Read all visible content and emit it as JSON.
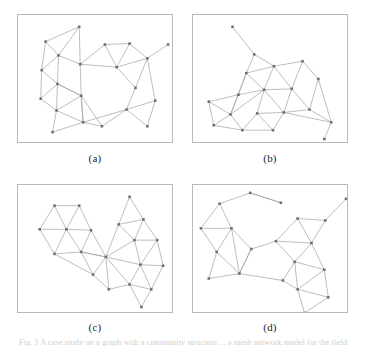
{
  "figure": {
    "type": "multi-panel-graph-figure",
    "panel_count": 4,
    "layout": "2x2",
    "width": 366,
    "height": 346,
    "background_color": "#ffffff",
    "frame_color": "#b9b9b9",
    "edge_color": "#a0a0a0",
    "node_color": "#707070",
    "node_size": 2.6
  },
  "labels": {
    "a": "(a)",
    "b": "(b)",
    "c": "(c)",
    "d": "(d)"
  },
  "caption": {
    "clipped_line": "Fig. 1   A case study on a graph with a community structure   ... a mesh network model for the field"
  },
  "chart_data": [
    {
      "type": "scatter",
      "id": "panel-a",
      "title": "(a)",
      "xlabel": "",
      "ylabel": "",
      "xlim": [
        0,
        156
      ],
      "ylim": [
        0,
        129
      ],
      "grid": false,
      "nodes": [
        {
          "id": 0,
          "x": 62,
          "y": 12
        },
        {
          "id": 1,
          "x": 28,
          "y": 27
        },
        {
          "id": 2,
          "x": 41,
          "y": 41
        },
        {
          "id": 3,
          "x": 24,
          "y": 56
        },
        {
          "id": 4,
          "x": 40,
          "y": 70
        },
        {
          "id": 5,
          "x": 23,
          "y": 85
        },
        {
          "id": 6,
          "x": 39,
          "y": 97
        },
        {
          "id": 7,
          "x": 35,
          "y": 119
        },
        {
          "id": 8,
          "x": 66,
          "y": 109
        },
        {
          "id": 9,
          "x": 64,
          "y": 82
        },
        {
          "id": 10,
          "x": 63,
          "y": 50
        },
        {
          "id": 11,
          "x": 85,
          "y": 113
        },
        {
          "id": 12,
          "x": 88,
          "y": 30
        },
        {
          "id": 13,
          "x": 113,
          "y": 29
        },
        {
          "id": 14,
          "x": 100,
          "y": 53
        },
        {
          "id": 15,
          "x": 119,
          "y": 74
        },
        {
          "id": 16,
          "x": 131,
          "y": 44
        },
        {
          "id": 17,
          "x": 110,
          "y": 96
        },
        {
          "id": 18,
          "x": 139,
          "y": 87
        },
        {
          "id": 19,
          "x": 131,
          "y": 113
        },
        {
          "id": 20,
          "x": 152,
          "y": 30
        }
      ],
      "edges": [
        [
          0,
          1
        ],
        [
          0,
          2
        ],
        [
          0,
          10
        ],
        [
          1,
          2
        ],
        [
          1,
          3
        ],
        [
          2,
          3
        ],
        [
          2,
          4
        ],
        [
          2,
          10
        ],
        [
          3,
          4
        ],
        [
          3,
          5
        ],
        [
          4,
          5
        ],
        [
          4,
          6
        ],
        [
          4,
          9
        ],
        [
          5,
          6
        ],
        [
          6,
          7
        ],
        [
          6,
          8
        ],
        [
          7,
          8
        ],
        [
          8,
          9
        ],
        [
          8,
          11
        ],
        [
          8,
          17
        ],
        [
          9,
          10
        ],
        [
          9,
          4
        ],
        [
          9,
          8
        ],
        [
          10,
          12
        ],
        [
          10,
          14
        ],
        [
          11,
          17
        ],
        [
          12,
          13
        ],
        [
          12,
          14
        ],
        [
          13,
          14
        ],
        [
          13,
          16
        ],
        [
          14,
          15
        ],
        [
          14,
          16
        ],
        [
          15,
          16
        ],
        [
          15,
          17
        ],
        [
          16,
          20
        ],
        [
          16,
          18
        ],
        [
          17,
          18
        ],
        [
          17,
          19
        ],
        [
          18,
          19
        ],
        [
          9,
          11
        ],
        [
          6,
          9
        ]
      ]
    },
    {
      "type": "scatter",
      "id": "panel-b",
      "title": "(b)",
      "xlabel": "",
      "ylabel": "",
      "xlim": [
        0,
        156
      ],
      "ylim": [
        0,
        129
      ],
      "grid": false,
      "nodes": [
        {
          "id": 0,
          "x": 40,
          "y": 12
        },
        {
          "id": 1,
          "x": 62,
          "y": 40
        },
        {
          "id": 2,
          "x": 54,
          "y": 59
        },
        {
          "id": 3,
          "x": 46,
          "y": 81
        },
        {
          "id": 4,
          "x": 16,
          "y": 88
        },
        {
          "id": 5,
          "x": 21,
          "y": 112
        },
        {
          "id": 6,
          "x": 38,
          "y": 101
        },
        {
          "id": 7,
          "x": 50,
          "y": 117
        },
        {
          "id": 8,
          "x": 65,
          "y": 100
        },
        {
          "id": 9,
          "x": 72,
          "y": 76
        },
        {
          "id": 10,
          "x": 82,
          "y": 52
        },
        {
          "id": 11,
          "x": 81,
          "y": 117
        },
        {
          "id": 12,
          "x": 92,
          "y": 99
        },
        {
          "id": 13,
          "x": 100,
          "y": 75
        },
        {
          "id": 14,
          "x": 111,
          "y": 47
        },
        {
          "id": 15,
          "x": 127,
          "y": 65
        },
        {
          "id": 16,
          "x": 118,
          "y": 96
        },
        {
          "id": 17,
          "x": 140,
          "y": 109
        },
        {
          "id": 18,
          "x": 133,
          "y": 126
        }
      ],
      "edges": [
        [
          0,
          1
        ],
        [
          1,
          2
        ],
        [
          1,
          10
        ],
        [
          2,
          3
        ],
        [
          2,
          9
        ],
        [
          2,
          10
        ],
        [
          3,
          4
        ],
        [
          3,
          6
        ],
        [
          3,
          9
        ],
        [
          4,
          5
        ],
        [
          4,
          6
        ],
        [
          5,
          6
        ],
        [
          5,
          7
        ],
        [
          6,
          7
        ],
        [
          6,
          9
        ],
        [
          7,
          8
        ],
        [
          7,
          11
        ],
        [
          8,
          9
        ],
        [
          8,
          11
        ],
        [
          8,
          12
        ],
        [
          9,
          10
        ],
        [
          9,
          12
        ],
        [
          9,
          13
        ],
        [
          10,
          13
        ],
        [
          10,
          14
        ],
        [
          11,
          12
        ],
        [
          12,
          13
        ],
        [
          12,
          16
        ],
        [
          13,
          14
        ],
        [
          13,
          16
        ],
        [
          14,
          15
        ],
        [
          15,
          16
        ],
        [
          15,
          17
        ],
        [
          16,
          17
        ],
        [
          17,
          18
        ],
        [
          12,
          17
        ],
        [
          2,
          6
        ]
      ]
    },
    {
      "type": "scatter",
      "id": "panel-c",
      "title": "(c)",
      "xlabel": "",
      "ylabel": "",
      "xlim": [
        0,
        156
      ],
      "ylim": [
        0,
        129
      ],
      "grid": false,
      "nodes": [
        {
          "id": 0,
          "x": 37,
          "y": 21
        },
        {
          "id": 1,
          "x": 62,
          "y": 21
        },
        {
          "id": 2,
          "x": 22,
          "y": 45
        },
        {
          "id": 3,
          "x": 49,
          "y": 45
        },
        {
          "id": 4,
          "x": 74,
          "y": 46
        },
        {
          "id": 5,
          "x": 37,
          "y": 70
        },
        {
          "id": 6,
          "x": 64,
          "y": 68
        },
        {
          "id": 7,
          "x": 89,
          "y": 73
        },
        {
          "id": 8,
          "x": 113,
          "y": 12
        },
        {
          "id": 9,
          "x": 102,
          "y": 40
        },
        {
          "id": 10,
          "x": 127,
          "y": 35
        },
        {
          "id": 11,
          "x": 118,
          "y": 56
        },
        {
          "id": 12,
          "x": 141,
          "y": 56
        },
        {
          "id": 13,
          "x": 124,
          "y": 81
        },
        {
          "id": 14,
          "x": 147,
          "y": 82
        },
        {
          "id": 15,
          "x": 76,
          "y": 91
        },
        {
          "id": 16,
          "x": 92,
          "y": 106
        },
        {
          "id": 17,
          "x": 113,
          "y": 101
        },
        {
          "id": 18,
          "x": 135,
          "y": 106
        },
        {
          "id": 19,
          "x": 125,
          "y": 124
        }
      ],
      "edges": [
        [
          0,
          1
        ],
        [
          0,
          2
        ],
        [
          0,
          3
        ],
        [
          1,
          3
        ],
        [
          1,
          4
        ],
        [
          2,
          3
        ],
        [
          2,
          5
        ],
        [
          3,
          4
        ],
        [
          3,
          5
        ],
        [
          3,
          6
        ],
        [
          4,
          6
        ],
        [
          4,
          7
        ],
        [
          5,
          6
        ],
        [
          5,
          15
        ],
        [
          6,
          7
        ],
        [
          6,
          15
        ],
        [
          7,
          9
        ],
        [
          7,
          11
        ],
        [
          7,
          13
        ],
        [
          7,
          15
        ],
        [
          7,
          16
        ],
        [
          7,
          17
        ],
        [
          8,
          9
        ],
        [
          8,
          10
        ],
        [
          9,
          10
        ],
        [
          9,
          11
        ],
        [
          10,
          11
        ],
        [
          10,
          12
        ],
        [
          11,
          12
        ],
        [
          11,
          13
        ],
        [
          12,
          13
        ],
        [
          12,
          14
        ],
        [
          13,
          14
        ],
        [
          13,
          17
        ],
        [
          14,
          18
        ],
        [
          15,
          16
        ],
        [
          16,
          17
        ],
        [
          17,
          18
        ],
        [
          17,
          19
        ],
        [
          18,
          19
        ],
        [
          7,
          6
        ],
        [
          13,
          18
        ]
      ]
    },
    {
      "type": "scatter",
      "id": "panel-d",
      "title": "(d)",
      "xlabel": "",
      "ylabel": "",
      "xlim": [
        0,
        156
      ],
      "ylim": [
        0,
        129
      ],
      "grid": false,
      "nodes": [
        {
          "id": 0,
          "x": 58,
          "y": 8
        },
        {
          "id": 1,
          "x": 27,
          "y": 19
        },
        {
          "id": 2,
          "x": 89,
          "y": 18
        },
        {
          "id": 3,
          "x": 8,
          "y": 44
        },
        {
          "id": 4,
          "x": 39,
          "y": 44
        },
        {
          "id": 5,
          "x": 24,
          "y": 68
        },
        {
          "id": 6,
          "x": 59,
          "y": 65
        },
        {
          "id": 7,
          "x": 16,
          "y": 95
        },
        {
          "id": 8,
          "x": 47,
          "y": 90
        },
        {
          "id": 9,
          "x": 84,
          "y": 57
        },
        {
          "id": 10,
          "x": 106,
          "y": 34
        },
        {
          "id": 11,
          "x": 134,
          "y": 36
        },
        {
          "id": 12,
          "x": 155,
          "y": 14
        },
        {
          "id": 13,
          "x": 120,
          "y": 59
        },
        {
          "id": 14,
          "x": 103,
          "y": 78
        },
        {
          "id": 15,
          "x": 91,
          "y": 97
        },
        {
          "id": 16,
          "x": 133,
          "y": 86
        },
        {
          "id": 17,
          "x": 106,
          "y": 106
        },
        {
          "id": 18,
          "x": 137,
          "y": 114
        },
        {
          "id": 19,
          "x": 113,
          "y": 130
        }
      ],
      "edges": [
        [
          0,
          1
        ],
        [
          0,
          2
        ],
        [
          1,
          3
        ],
        [
          1,
          4
        ],
        [
          3,
          4
        ],
        [
          3,
          5
        ],
        [
          4,
          5
        ],
        [
          4,
          6
        ],
        [
          4,
          8
        ],
        [
          5,
          7
        ],
        [
          5,
          8
        ],
        [
          6,
          8
        ],
        [
          6,
          9
        ],
        [
          7,
          8
        ],
        [
          8,
          15
        ],
        [
          9,
          10
        ],
        [
          9,
          13
        ],
        [
          9,
          14
        ],
        [
          10,
          11
        ],
        [
          10,
          13
        ],
        [
          11,
          12
        ],
        [
          11,
          13
        ],
        [
          13,
          14
        ],
        [
          13,
          16
        ],
        [
          14,
          15
        ],
        [
          14,
          17
        ],
        [
          15,
          17
        ],
        [
          16,
          17
        ],
        [
          16,
          18
        ],
        [
          17,
          18
        ],
        [
          17,
          19
        ],
        [
          18,
          19
        ],
        [
          2,
          0
        ],
        [
          8,
          6
        ],
        [
          14,
          16
        ]
      ]
    }
  ]
}
